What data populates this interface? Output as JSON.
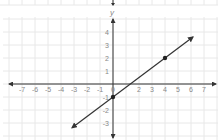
{
  "chart_data": {
    "type": "line",
    "title": "",
    "xlabel": "",
    "ylabel": "y",
    "xlim": [
      -8,
      8
    ],
    "ylim": [
      -4,
      5
    ],
    "grid": true,
    "x_ticks": [
      -7,
      -6,
      -5,
      -4,
      -3,
      -2,
      -1,
      0,
      2,
      3,
      4,
      5,
      6,
      7
    ],
    "y_ticks": [
      4,
      3,
      2,
      1,
      -1,
      -2,
      -3
    ],
    "series": [
      {
        "name": "line",
        "equation": "y = 0.75x - 1",
        "slope": 0.75,
        "intercept": -1,
        "x": [
          -3.15,
          6.15
        ],
        "y": [
          -3.36,
          3.61
        ],
        "arrows": "both",
        "color": "#333333"
      }
    ],
    "points": [
      {
        "x": 0,
        "y": -1
      },
      {
        "x": 4,
        "y": 2
      }
    ]
  },
  "colors": {
    "axis": "#333333",
    "grid": "#e8e8e8",
    "line": "#333333",
    "point": "#222222",
    "label": "#888888"
  },
  "layout": {
    "origin_px": [
      113,
      84
    ],
    "unit_px": 13
  }
}
